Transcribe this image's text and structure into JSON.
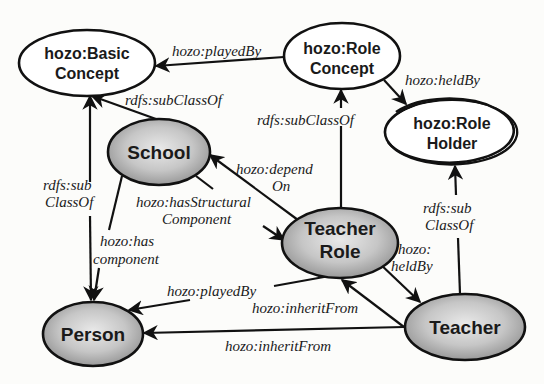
{
  "diagram": {
    "title": "",
    "colors": {
      "background": "#fcfcfa",
      "concept_fill": "#ffffff",
      "instance_fill_light": "#e6e6e6",
      "instance_fill_dark": "#8e8e8e",
      "stroke": "#111111"
    },
    "nodes": {
      "basic_concept": {
        "line1": "hozo:Basic",
        "line2": "Concept",
        "kind": "concept"
      },
      "role_concept": {
        "line1": "hozo:Role",
        "line2": "Concept",
        "kind": "concept"
      },
      "role_holder": {
        "line1": "hozo:Role",
        "line2": "Holder",
        "kind": "concept"
      },
      "school": {
        "line1": "School",
        "kind": "class"
      },
      "teacher_role": {
        "line1": "Teacher",
        "line2": "Role",
        "kind": "class"
      },
      "person": {
        "line1": "Person",
        "kind": "class"
      },
      "teacher": {
        "line1": "Teacher",
        "kind": "class"
      }
    },
    "edges": {
      "role_concept_played_by_basic": {
        "label": "hozo:playedBy",
        "from": "hozo:Role Concept",
        "to": "hozo:Basic Concept"
      },
      "role_concept_held_by_holder": {
        "label": "hozo:heldBy",
        "from": "hozo:Role Concept",
        "to": "hozo:Role Holder"
      },
      "school_subclass_basic": {
        "label": "rdfs:subClassOf",
        "from": "School",
        "to": "hozo:Basic Concept"
      },
      "person_subclass_basic": {
        "line1": "rdfs:sub",
        "line2": "ClassOf",
        "from": "Person",
        "to": "hozo:Basic Concept"
      },
      "teacher_role_subclass_role": {
        "label": "rdfs:subClassOf",
        "from": "Teacher Role",
        "to": "hozo:Role Concept"
      },
      "teacher_subclass_holder": {
        "line1": "rdfs:sub",
        "line2": "ClassOf",
        "from": "Teacher",
        "to": "hozo:Role Holder"
      },
      "teacher_role_depend_on": {
        "line1": "hozo:depend",
        "line2": "On",
        "from": "Teacher Role",
        "to": "School"
      },
      "school_has_structural": {
        "line1": "hozo:hasStructural",
        "line2": "Component",
        "from": "School",
        "to": "Teacher Role"
      },
      "school_has_component": {
        "line1": "hozo:has",
        "line2": "component",
        "from": "School",
        "to": "Person"
      },
      "teacher_role_played_by": {
        "label": "hozo:playedBy",
        "from": "Teacher Role",
        "to": "Person"
      },
      "teacher_role_held_by": {
        "line1": "hozo:",
        "line2": "heldBy",
        "from": "Teacher Role",
        "to": "Teacher"
      },
      "teacher_inherit_role": {
        "label": "hozo:inheritFrom",
        "from": "Teacher",
        "to": "Teacher Role"
      },
      "teacher_inherit_person": {
        "label": "hozo:inheritFrom",
        "from": "Teacher",
        "to": "Person"
      }
    }
  }
}
